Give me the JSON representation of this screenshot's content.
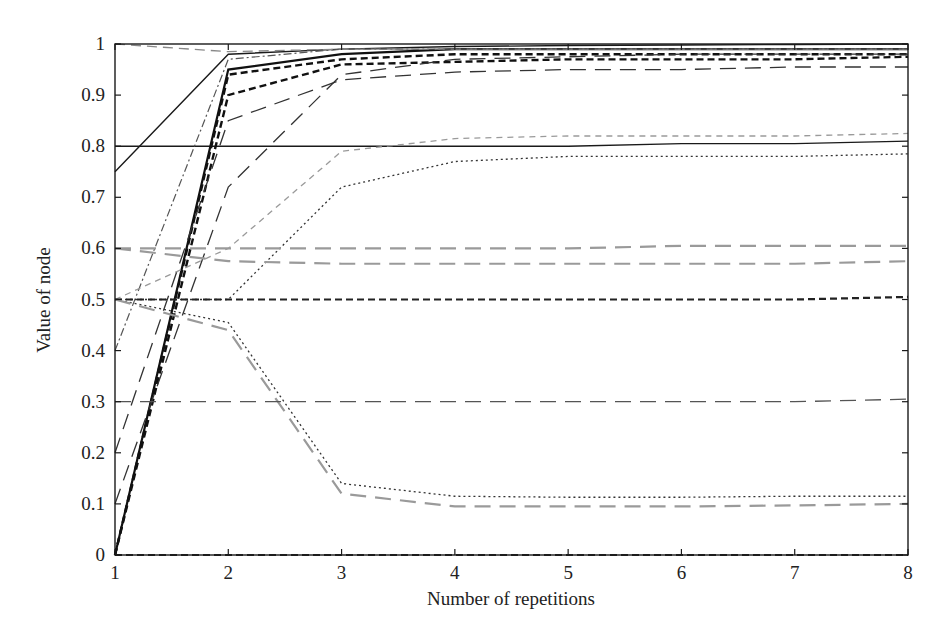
{
  "chart_data": {
    "type": "line",
    "title": "",
    "xlabel": "Number of repetitions",
    "ylabel": "Value of node",
    "xlim": [
      1,
      8
    ],
    "ylim": [
      0,
      1
    ],
    "grid": false,
    "legend": null,
    "x": [
      1,
      2,
      3,
      4,
      5,
      6,
      7,
      8
    ],
    "x_ticks": [
      "1",
      "2",
      "3",
      "4",
      "5",
      "6",
      "7",
      "8"
    ],
    "y_ticks": [
      "0",
      "0.1",
      "0.2",
      "0.3",
      "0.4",
      "0.5",
      "0.6",
      "0.7",
      "0.8",
      "0.9",
      "1"
    ],
    "series": [
      {
        "name": "s1",
        "style": "solid",
        "color": "#1a1a1a",
        "width": 1.4,
        "values": [
          0.75,
          0.98,
          0.99,
          0.995,
          0.997,
          0.998,
          0.999,
          1.0
        ]
      },
      {
        "name": "s2",
        "style": "solid",
        "color": "#1a1a1a",
        "width": 1.4,
        "values": [
          0.8,
          0.8,
          0.8,
          0.8,
          0.8,
          0.805,
          0.805,
          0.81
        ]
      },
      {
        "name": "s3",
        "style": "solid",
        "color": "#111111",
        "width": 2.2,
        "values": [
          0.0,
          0.95,
          0.98,
          0.99,
          0.99,
          0.99,
          0.99,
          0.99
        ]
      },
      {
        "name": "s4",
        "style": "dashed-thick",
        "color": "#111111",
        "width": 2.4,
        "values": [
          0.0,
          0.94,
          0.97,
          0.98,
          0.98,
          0.98,
          0.98,
          0.98
        ]
      },
      {
        "name": "s5",
        "style": "dashed-thick",
        "color": "#111111",
        "width": 2.4,
        "values": [
          0.0,
          0.9,
          0.96,
          0.965,
          0.97,
          0.97,
          0.97,
          0.975
        ]
      },
      {
        "name": "s6",
        "style": "long-dash",
        "color": "#333333",
        "width": 1.3,
        "values": [
          0.2,
          0.85,
          0.93,
          0.945,
          0.95,
          0.95,
          0.955,
          0.955
        ]
      },
      {
        "name": "s7",
        "style": "long-dash",
        "color": "#333333",
        "width": 1.3,
        "values": [
          0.1,
          0.72,
          0.94,
          0.97,
          0.975,
          0.98,
          0.98,
          0.98
        ]
      },
      {
        "name": "s8",
        "style": "dash-dot",
        "color": "#555555",
        "width": 1.2,
        "values": [
          0.4,
          0.97,
          0.99,
          0.99,
          0.99,
          0.99,
          0.99,
          0.99
        ]
      },
      {
        "name": "s9",
        "style": "dashed",
        "color": "#888888",
        "width": 1.3,
        "values": [
          1.0,
          0.985,
          0.99,
          0.99,
          0.99,
          0.99,
          0.99,
          0.99
        ]
      },
      {
        "name": "s10",
        "style": "short-dash",
        "color": "#9a9a9a",
        "width": 1.3,
        "values": [
          0.5,
          0.6,
          0.79,
          0.815,
          0.82,
          0.82,
          0.82,
          0.825
        ]
      },
      {
        "name": "s11",
        "style": "dotted",
        "color": "#333333",
        "width": 1.3,
        "values": [
          0.5,
          0.5,
          0.72,
          0.77,
          0.78,
          0.78,
          0.78,
          0.785
        ]
      },
      {
        "name": "s12",
        "style": "long-dash",
        "color": "#9a9a9a",
        "width": 2.2,
        "values": [
          0.6,
          0.6,
          0.6,
          0.6,
          0.6,
          0.605,
          0.605,
          0.605
        ]
      },
      {
        "name": "s13",
        "style": "long-dash",
        "color": "#9a9a9a",
        "width": 2.2,
        "values": [
          0.6,
          0.575,
          0.57,
          0.57,
          0.57,
          0.57,
          0.57,
          0.575
        ]
      },
      {
        "name": "s14",
        "style": "dashed-thick",
        "color": "#222222",
        "width": 2.2,
        "values": [
          0.5,
          0.5,
          0.5,
          0.5,
          0.5,
          0.5,
          0.5,
          0.505
        ]
      },
      {
        "name": "s15",
        "style": "dotted",
        "color": "#333333",
        "width": 1.3,
        "values": [
          0.5,
          0.455,
          0.14,
          0.115,
          0.113,
          0.113,
          0.115,
          0.115
        ]
      },
      {
        "name": "s16",
        "style": "long-dash",
        "color": "#9a9a9a",
        "width": 2.2,
        "values": [
          0.5,
          0.44,
          0.12,
          0.095,
          0.095,
          0.095,
          0.097,
          0.1
        ]
      },
      {
        "name": "s17",
        "style": "long-dash",
        "color": "#555555",
        "width": 1.3,
        "values": [
          0.3,
          0.3,
          0.3,
          0.3,
          0.3,
          0.3,
          0.3,
          0.305
        ]
      },
      {
        "name": "s18",
        "style": "dashed-thick",
        "color": "#222222",
        "width": 2.2,
        "values": [
          0.0,
          0.0,
          0.0,
          0.0,
          0.0,
          0.0,
          0.0,
          0.0
        ]
      }
    ]
  },
  "axes": {
    "xlabel": "Number of repetitions",
    "ylabel": "Value of node"
  }
}
